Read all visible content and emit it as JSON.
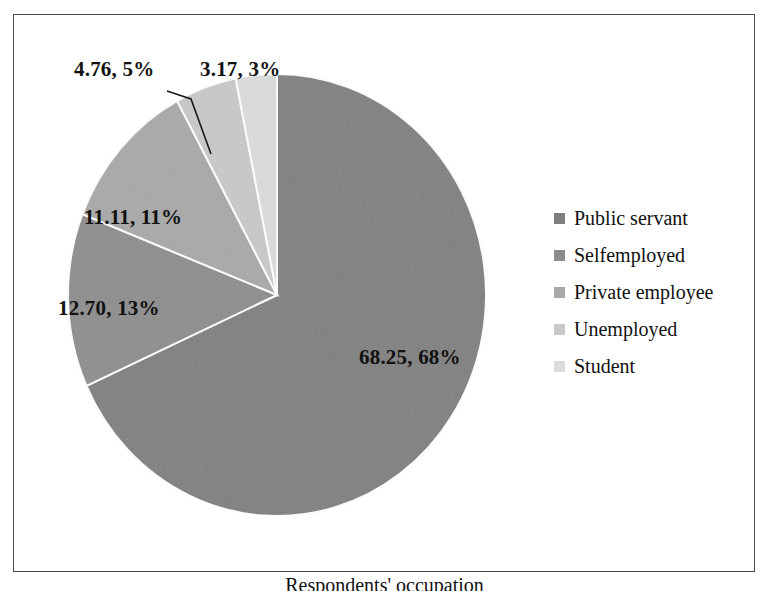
{
  "chart_data": {
    "type": "pie",
    "title": "",
    "xlabel": "Respondents' occupation",
    "ylabel": "",
    "categories": [
      "Public servant",
      "Selfemployed",
      "Private employee",
      "Unemployed",
      "Student"
    ],
    "values": [
      68.25,
      12.7,
      11.11,
      4.76,
      3.17
    ],
    "data_labels": [
      "68.25, 68%",
      "12.70, 13%",
      "11.11, 11%",
      "4.76, 5%",
      "3.17, 3%"
    ],
    "percent_labels": [
      "68%",
      "13%",
      "11%",
      "5%",
      "3%"
    ],
    "colors": [
      "#7e7e7e",
      "#8c8c8c",
      "#a8a8a8",
      "#c9c9c9",
      "#dcdcdc"
    ],
    "legend_position": "right",
    "grid": false,
    "start_angle_deg": 0,
    "slice_border_color": "#ffffff"
  },
  "legend": {
    "items": [
      {
        "label": "Public servant",
        "color": "#7e7e7e"
      },
      {
        "label": "Selfemployed",
        "color": "#8c8c8c"
      },
      {
        "label": "Private employee",
        "color": "#a8a8a8"
      },
      {
        "label": "Unemployed",
        "color": "#c9c9c9"
      },
      {
        "label": "Student",
        "color": "#dcdcdc"
      }
    ]
  },
  "axis": {
    "title": "Respondents' occupation"
  },
  "frame": {
    "border_color": "#4a4a4a"
  }
}
